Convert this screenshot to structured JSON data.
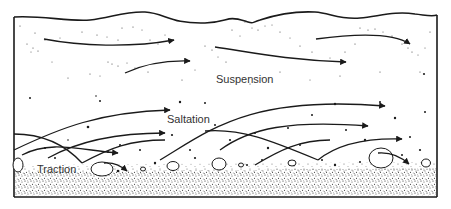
{
  "diagram": {
    "labels": {
      "suspension": "Suspension",
      "saltation": "Saltation",
      "traction": "Traction"
    },
    "colors": {
      "ink": "#1a1a1a",
      "label": "#333333",
      "background": "#ffffff"
    },
    "zones": [
      {
        "name": "Suspension",
        "description": "fine particles carried high in the flow with long gentle arrows"
      },
      {
        "name": "Saltation",
        "description": "particles bouncing along arcing paths"
      },
      {
        "name": "Traction",
        "description": "large grains rolling and sliding along the bed"
      }
    ]
  }
}
